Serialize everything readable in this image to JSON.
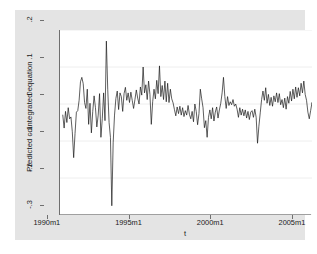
{
  "chart_data": {
    "type": "line",
    "title": "",
    "subtitle": "",
    "xlabel": "t",
    "ylabel": "Predicted cointegrated equation",
    "xtick_labels": [
      "1990m1",
      "1995m1",
      "2000m1",
      "2005m1"
    ],
    "xtick_values": [
      1990.0,
      1995.0,
      2000.0,
      2005.0
    ],
    "ytick_labels": [
      ".2",
      ".1",
      "0",
      "-.1",
      "-.2",
      "-.3"
    ],
    "ytick_values": [
      0.2,
      0.1,
      0,
      -0.1,
      -0.2,
      -0.3
    ],
    "xlim": [
      1989.83,
      2005.25
    ],
    "ylim": [
      -0.3,
      0.2
    ],
    "grid": "horizontal",
    "legend": "none",
    "line_color": "#1a1a1a",
    "line_width": 0.7,
    "series": [
      {
        "name": "Predicted cointegrated equation",
        "x_start": 1990.0,
        "x_step": 0.08333,
        "values": [
          -0.03,
          -0.065,
          -0.02,
          -0.05,
          -0.01,
          -0.04,
          -0.035,
          -0.075,
          -0.145,
          -0.08,
          -0.022,
          -0.018,
          0.01,
          0.06,
          0.072,
          0.055,
          0.004,
          -0.012,
          0.04,
          -0.055,
          0.002,
          -0.078,
          -0.02,
          0.022,
          -0.01,
          -0.062,
          -0.03,
          0.028,
          -0.09,
          -0.04,
          0.03,
          -0.045,
          0.17,
          0.04,
          -0.05,
          -0.09,
          -0.275,
          -0.105,
          -0.03,
          0.015,
          0.035,
          -0.015,
          0.03,
          0.02,
          -0.02,
          0.028,
          0.045,
          0.01,
          0.03,
          0.004,
          0.032,
          0.01,
          -0.012,
          0.012,
          0.038,
          0.016,
          0.0,
          0.046,
          0.024,
          0.1,
          0.03,
          0.052,
          0.012,
          0.062,
          0.026,
          -0.055,
          0.006,
          0.04,
          0.014,
          0.064,
          0.028,
          0.103,
          0.02,
          0.05,
          0.012,
          0.062,
          0.006,
          0.056,
          0.004,
          0.04,
          0.014,
          0.003,
          -0.015,
          -0.032,
          -0.008,
          -0.026,
          -0.006,
          -0.03,
          -0.01,
          -0.034,
          -0.018,
          -0.03,
          -0.004,
          -0.028,
          -0.04,
          -0.02,
          -0.048,
          0.0,
          -0.02,
          -0.056,
          -0.026,
          0.04,
          0.014,
          -0.01,
          -0.064,
          -0.045,
          -0.09,
          -0.036,
          -0.016,
          -0.04,
          -0.01,
          -0.046,
          -0.022,
          -0.008,
          -0.038,
          -0.016,
          0.002,
          0.03,
          0.072,
          0.02,
          -0.012,
          0.02,
          -0.004,
          0.006,
          -0.002,
          0.012,
          -0.006,
          0.0,
          -0.014,
          -0.036,
          -0.01,
          -0.03,
          -0.014,
          -0.032,
          -0.016,
          -0.038,
          -0.02,
          -0.042,
          -0.022,
          -0.018,
          -0.036,
          -0.014,
          -0.036,
          -0.106,
          -0.06,
          -0.024,
          0.012,
          0.035,
          0.01,
          0.044,
          0.002,
          0.026,
          -0.004,
          0.018,
          -0.006,
          0.022,
          0.006,
          0.03,
          0.004,
          0.028,
          -0.002,
          0.012,
          -0.01,
          0.016,
          -0.014,
          0.02,
          0.002,
          0.034,
          0.008,
          0.04,
          0.014,
          0.046,
          0.018,
          0.044,
          0.022,
          0.056,
          0.03,
          0.062,
          0.026,
          0.01,
          -0.022,
          -0.04,
          -0.018,
          0.004,
          -0.01,
          0.006,
          -0.012,
          0.01,
          -0.006,
          0.014,
          0.0,
          0.018
        ]
      }
    ]
  }
}
